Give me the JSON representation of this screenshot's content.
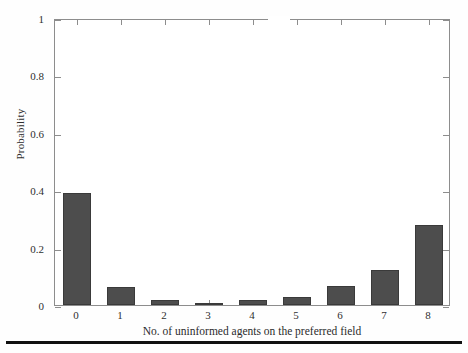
{
  "figure": {
    "background_color": "#ffffff",
    "bar_color": "#4d4d4d",
    "axis_color": "#8d8d8d",
    "rule_color": "#111111"
  },
  "axes": {
    "y_title": "Probability",
    "x_title": "No. of uninformed agents on the preferred field",
    "y_ticks": [
      "0",
      "0.2",
      "0.4",
      "0.6",
      "0.8",
      "1"
    ],
    "y_tick_values": [
      0,
      0.2,
      0.4,
      0.6,
      0.8,
      1
    ],
    "x_ticks": [
      "0",
      "1",
      "2",
      "3",
      "4",
      "5",
      "6",
      "7",
      "8"
    ]
  },
  "chart_data": {
    "type": "bar",
    "title": "",
    "xlabel": "No. of uninformed agents on the preferred field",
    "ylabel": "Probability",
    "categories": [
      "0",
      "1",
      "2",
      "3",
      "4",
      "5",
      "6",
      "7",
      "8"
    ],
    "values": [
      0.39,
      0.063,
      0.017,
      0.007,
      0.018,
      0.027,
      0.065,
      0.122,
      0.279
    ],
    "ylim": [
      0,
      1
    ],
    "xlim": [
      -0.5,
      8.5
    ],
    "yticks": [
      0,
      0.2,
      0.4,
      0.6,
      0.8,
      1
    ],
    "grid": false,
    "legend": null,
    "legend_position": "none",
    "series": [
      {
        "name": "Probability",
        "values": [
          0.39,
          0.063,
          0.017,
          0.007,
          0.018,
          0.027,
          0.065,
          0.122,
          0.279
        ],
        "color": "#4d4d4d"
      }
    ],
    "annotations": []
  }
}
